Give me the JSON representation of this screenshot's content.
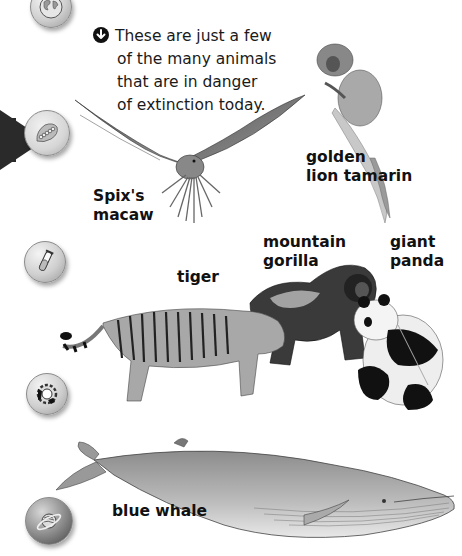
{
  "page": {
    "intro_lines": [
      "These are just a few",
      "of the many animals",
      "that are in danger",
      "of extinction today."
    ],
    "intro_icon": "down-arrow-circle-icon"
  },
  "sidebar": {
    "items": [
      {
        "icon": "globe-icon",
        "active": false
      },
      {
        "icon": "leaf-caterpillar-icon",
        "active": true
      },
      {
        "icon": "test-tube-icon",
        "active": false
      },
      {
        "icon": "gear-icon",
        "active": false
      },
      {
        "icon": "planet-icon",
        "active": false
      }
    ],
    "active_indicator": "pointer-arrow-icon"
  },
  "animals": [
    {
      "id": "spixs-macaw",
      "label_lines": [
        "Spix's",
        "macaw"
      ]
    },
    {
      "id": "golden-lion-tamarin",
      "label_lines": [
        "golden",
        "lion tamarin"
      ]
    },
    {
      "id": "tiger",
      "label_lines": [
        "tiger"
      ]
    },
    {
      "id": "mountain-gorilla",
      "label_lines": [
        "mountain",
        "gorilla"
      ]
    },
    {
      "id": "giant-panda",
      "label_lines": [
        "giant",
        "panda"
      ]
    },
    {
      "id": "blue-whale",
      "label_lines": [
        "blue whale"
      ]
    }
  ],
  "colors": {
    "text": "#111111",
    "button_light": "#cfcfcf",
    "button_dark": "#555555",
    "pointer": "#2a2a2a"
  }
}
